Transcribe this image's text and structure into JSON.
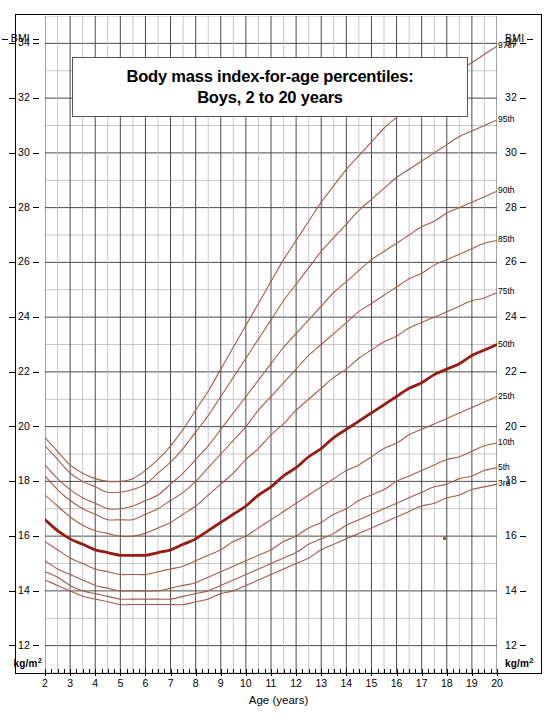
{
  "title": {
    "line1": "Body mass index-for-age percentiles:",
    "line2": "Boys, 2 to 20 years"
  },
  "axes": {
    "y_unit_top": "BMI",
    "y_unit_bottom_text": "kg/m",
    "y_unit_bottom_sup": "2",
    "x_title": "Age (years)",
    "y_ticks": [
      34,
      32,
      30,
      28,
      26,
      24,
      22,
      20,
      18,
      16,
      14,
      12
    ],
    "x_ticks": [
      2,
      3,
      4,
      5,
      6,
      7,
      8,
      9,
      10,
      11,
      12,
      13,
      14,
      15,
      16,
      17,
      18,
      19,
      20
    ]
  },
  "colors": {
    "curve": "#a85a4a",
    "curve_median": "#981b12",
    "grid_major": "#4a4a4a",
    "grid_minor": "#b9b9b9",
    "frame": "#000000"
  },
  "chart_data": {
    "type": "line",
    "title": "Body mass index-for-age percentiles: Boys, 2 to 20 years",
    "xlabel": "Age (years)",
    "ylabel": "BMI (kg/m2)",
    "xlim": [
      2,
      20
    ],
    "ylim": [
      11,
      35
    ],
    "grid": true,
    "legend": "right-edge-inline-labels",
    "x": [
      2,
      2.5,
      3,
      3.5,
      4,
      4.5,
      5,
      5.5,
      6,
      6.5,
      7,
      7.5,
      8,
      8.5,
      9,
      9.5,
      10,
      10.5,
      11,
      11.5,
      12,
      12.5,
      13,
      13.5,
      14,
      14.5,
      15,
      15.5,
      16,
      16.5,
      17,
      17.5,
      18,
      18.5,
      19,
      19.5,
      20
    ],
    "series": [
      {
        "name": "97th",
        "label": "97th",
        "values": [
          19.6,
          19.1,
          18.6,
          18.3,
          18.1,
          18.0,
          18.0,
          18.1,
          18.4,
          18.8,
          19.3,
          19.9,
          20.6,
          21.3,
          22.1,
          22.9,
          23.7,
          24.5,
          25.3,
          26.1,
          26.8,
          27.5,
          28.2,
          28.8,
          29.4,
          29.9,
          30.4,
          30.9,
          31.3,
          31.7,
          32.1,
          32.4,
          32.7,
          33.0,
          33.3,
          33.6,
          33.9
        ]
      },
      {
        "name": "95th",
        "label": "95th",
        "values": [
          19.3,
          18.8,
          18.3,
          18.0,
          17.8,
          17.6,
          17.6,
          17.7,
          17.9,
          18.3,
          18.7,
          19.2,
          19.8,
          20.4,
          21.1,
          21.8,
          22.5,
          23.2,
          23.9,
          24.6,
          25.2,
          25.8,
          26.4,
          26.9,
          27.4,
          27.9,
          28.3,
          28.7,
          29.1,
          29.4,
          29.7,
          30.0,
          30.3,
          30.6,
          30.8,
          31.0,
          31.2
        ]
      },
      {
        "name": "90th",
        "label": "90th",
        "values": [
          18.6,
          18.1,
          17.7,
          17.4,
          17.2,
          17.0,
          17.0,
          17.1,
          17.3,
          17.5,
          17.9,
          18.3,
          18.8,
          19.3,
          19.9,
          20.5,
          21.1,
          21.7,
          22.3,
          22.9,
          23.4,
          23.9,
          24.4,
          24.9,
          25.3,
          25.7,
          26.1,
          26.4,
          26.7,
          27.0,
          27.3,
          27.5,
          27.8,
          28.0,
          28.2,
          28.4,
          28.6
        ]
      },
      {
        "name": "85th",
        "label": "85th",
        "values": [
          18.2,
          17.7,
          17.3,
          17.0,
          16.8,
          16.6,
          16.6,
          16.6,
          16.8,
          17.0,
          17.3,
          17.6,
          18.0,
          18.5,
          19.0,
          19.5,
          20.0,
          20.6,
          21.1,
          21.6,
          22.1,
          22.6,
          23.0,
          23.4,
          23.8,
          24.2,
          24.5,
          24.8,
          25.1,
          25.4,
          25.6,
          25.9,
          26.1,
          26.3,
          26.5,
          26.7,
          26.8
        ]
      },
      {
        "name": "75th",
        "label": "75th",
        "values": [
          17.5,
          17.1,
          16.7,
          16.4,
          16.2,
          16.1,
          16.0,
          16.0,
          16.1,
          16.3,
          16.5,
          16.8,
          17.1,
          17.5,
          17.9,
          18.3,
          18.8,
          19.2,
          19.7,
          20.1,
          20.6,
          21.0,
          21.4,
          21.8,
          22.1,
          22.5,
          22.8,
          23.1,
          23.3,
          23.6,
          23.8,
          24.0,
          24.2,
          24.4,
          24.6,
          24.7,
          24.9
        ]
      },
      {
        "name": "50th",
        "label": "50th",
        "emphasis": true,
        "values": [
          16.6,
          16.2,
          15.9,
          15.7,
          15.5,
          15.4,
          15.3,
          15.3,
          15.3,
          15.4,
          15.5,
          15.7,
          15.9,
          16.2,
          16.5,
          16.8,
          17.1,
          17.5,
          17.8,
          18.2,
          18.5,
          18.9,
          19.2,
          19.6,
          19.9,
          20.2,
          20.5,
          20.8,
          21.1,
          21.4,
          21.6,
          21.9,
          22.1,
          22.3,
          22.6,
          22.8,
          23.0
        ]
      },
      {
        "name": "25th",
        "label": "25th",
        "values": [
          15.8,
          15.5,
          15.2,
          15.0,
          14.8,
          14.7,
          14.6,
          14.6,
          14.6,
          14.7,
          14.8,
          14.9,
          15.1,
          15.3,
          15.5,
          15.8,
          16.0,
          16.3,
          16.6,
          16.9,
          17.2,
          17.5,
          17.8,
          18.1,
          18.4,
          18.6,
          18.9,
          19.2,
          19.4,
          19.7,
          19.9,
          20.1,
          20.3,
          20.5,
          20.7,
          20.9,
          21.1
        ]
      },
      {
        "name": "10th",
        "label": "10th",
        "values": [
          15.1,
          14.8,
          14.6,
          14.4,
          14.2,
          14.1,
          14.0,
          14.0,
          14.0,
          14.0,
          14.1,
          14.2,
          14.3,
          14.5,
          14.7,
          14.9,
          15.1,
          15.3,
          15.5,
          15.8,
          16.0,
          16.3,
          16.5,
          16.8,
          17.0,
          17.3,
          17.5,
          17.7,
          18.0,
          18.2,
          18.4,
          18.6,
          18.8,
          18.9,
          19.1,
          19.3,
          19.4
        ]
      },
      {
        "name": "5th",
        "label": "5th",
        "values": [
          14.7,
          14.5,
          14.2,
          14.0,
          13.9,
          13.8,
          13.7,
          13.7,
          13.7,
          13.7,
          13.7,
          13.8,
          13.9,
          14.0,
          14.2,
          14.4,
          14.6,
          14.8,
          15.0,
          15.2,
          15.4,
          15.7,
          15.9,
          16.1,
          16.4,
          16.6,
          16.8,
          17.0,
          17.2,
          17.4,
          17.6,
          17.8,
          17.9,
          18.1,
          18.2,
          18.4,
          18.5
        ]
      },
      {
        "name": "3rd",
        "label": "3rd",
        "values": [
          14.4,
          14.2,
          14.0,
          13.8,
          13.7,
          13.6,
          13.5,
          13.5,
          13.5,
          13.5,
          13.5,
          13.5,
          13.6,
          13.7,
          13.9,
          14.0,
          14.2,
          14.4,
          14.6,
          14.8,
          15.0,
          15.2,
          15.5,
          15.7,
          15.9,
          16.1,
          16.3,
          16.5,
          16.7,
          16.9,
          17.1,
          17.2,
          17.4,
          17.5,
          17.7,
          17.8,
          17.9
        ]
      }
    ]
  }
}
